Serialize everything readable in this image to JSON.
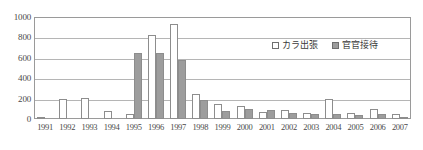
{
  "chart_data": {
    "type": "bar",
    "title": "",
    "subtitle": "",
    "xlabel": "",
    "ylabel": "",
    "ylim": [
      0,
      1000
    ],
    "yticks": [
      0,
      200,
      400,
      600,
      800,
      1000
    ],
    "ytick_labels": [
      "0",
      "200",
      "400",
      "600",
      "800",
      "1000"
    ],
    "grid": true,
    "legend_position": "upper-right-inside",
    "categories": [
      "1991",
      "1992",
      "1993",
      "1994",
      "1995",
      "1996",
      "1997",
      "1998",
      "1999",
      "2000",
      "2001",
      "2002",
      "2003",
      "2004",
      "2005",
      "2006",
      "2007"
    ],
    "series": [
      {
        "name": "カラ出張",
        "color": "#ffffff",
        "edge_color": "#8d8d8d",
        "values": [
          20,
          200,
          205,
          75,
          50,
          820,
          935,
          245,
          150,
          125,
          70,
          85,
          60,
          195,
          55,
          95,
          45
        ]
      },
      {
        "name": "官官接待",
        "color": "#9d9d9d",
        "edge_color": "#8d8d8d",
        "values": [
          0,
          0,
          0,
          5,
          645,
          650,
          580,
          185,
          75,
          100,
          85,
          55,
          45,
          45,
          35,
          45,
          20
        ]
      }
    ]
  },
  "legend": {
    "items": [
      {
        "label": "カラ出張",
        "swatch": "legend-swatch-kara"
      },
      {
        "label": "官官接待",
        "swatch": "legend-swatch-kankan"
      }
    ]
  }
}
